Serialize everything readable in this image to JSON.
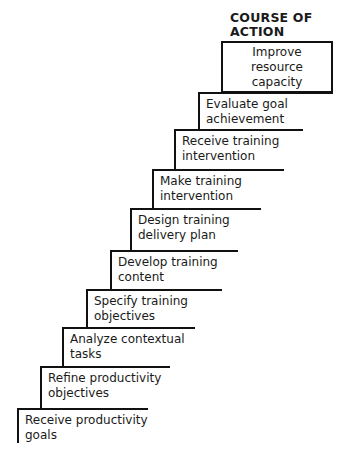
{
  "diagram": {
    "heading": "COURSE OF\nACTION",
    "top_box": {
      "label": "Improve\nresource\ncapacity"
    },
    "steps": [
      {
        "label": "Evaluate goal\nachievement",
        "left": 198,
        "top": 92,
        "right": 333,
        "height": 38
      },
      {
        "label": "Receive training\nintervention",
        "left": 174,
        "top": 129,
        "right": 303,
        "height": 41
      },
      {
        "label": "Make training\nintervention",
        "left": 152,
        "top": 169,
        "right": 284,
        "height": 40
      },
      {
        "label": "Design training\ndelivery plan",
        "left": 130,
        "top": 208,
        "right": 261,
        "height": 42
      },
      {
        "label": "Develop training\ncontent",
        "left": 110,
        "top": 250,
        "right": 238,
        "height": 40
      },
      {
        "label": "Specify training\nobjectives",
        "left": 86,
        "top": 289,
        "right": 222,
        "height": 39
      },
      {
        "label": "Analyze contextual\ntasks",
        "left": 62,
        "top": 327,
        "right": 195,
        "height": 40
      },
      {
        "label": "Refine productivity\nobjectives",
        "left": 40,
        "top": 366,
        "right": 170,
        "height": 43
      },
      {
        "label": "Receive productivity\ngoals",
        "left": 17,
        "top": 408,
        "right": 148,
        "height": 35
      }
    ]
  }
}
